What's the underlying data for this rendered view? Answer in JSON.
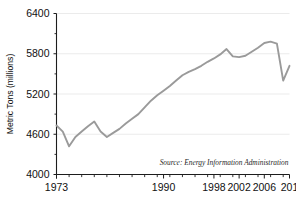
{
  "chart_data": {
    "type": "line",
    "title": "",
    "xlabel": "",
    "ylabel": "Metric Tons (millions)",
    "xlim": [
      1973,
      2010
    ],
    "ylim": [
      4000,
      6400
    ],
    "ytick_labels": [
      "6400",
      "5800",
      "5200",
      "4600",
      "4000"
    ],
    "ytick_values": [
      6400,
      5800,
      5200,
      4600,
      4000
    ],
    "xtick_labels": [
      "1973",
      "1990",
      "1998",
      "2002",
      "2006",
      "201"
    ],
    "xtick_values": [
      1973,
      1990,
      1998,
      2002,
      2006,
      2010
    ],
    "grid": "horizontal",
    "legend": "none",
    "line_color": "#9a9a9a",
    "axis_color": "#1d1d1d",
    "grid_color": "#e2e2e2",
    "x": [
      1973,
      1974,
      1975,
      1976,
      1977,
      1978,
      1979,
      1980,
      1981,
      1982,
      1983,
      1984,
      1985,
      1986,
      1987,
      1988,
      1989,
      1990,
      1991,
      1992,
      1993,
      1994,
      1995,
      1996,
      1997,
      1998,
      1999,
      2000,
      2001,
      2002,
      2003,
      2004,
      2005,
      2006,
      2007,
      2008,
      2009,
      2010
    ],
    "values": [
      4730,
      4640,
      4420,
      4560,
      4640,
      4720,
      4790,
      4640,
      4560,
      4620,
      4680,
      4760,
      4830,
      4900,
      5000,
      5100,
      5180,
      5250,
      5320,
      5400,
      5480,
      5530,
      5570,
      5620,
      5680,
      5730,
      5790,
      5870,
      5760,
      5750,
      5770,
      5830,
      5890,
      5960,
      5980,
      5950,
      5400,
      5620
    ],
    "annotations": [
      {
        "name": "source-note",
        "text": "Source: Energy Information Administration"
      }
    ]
  },
  "axis": {
    "y_title": "Metric Tons (millions)"
  },
  "source": {
    "note": "Source: Energy Information Administration"
  }
}
